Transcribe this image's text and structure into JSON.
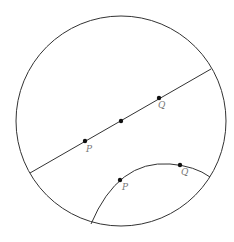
{
  "diagram": {
    "type": "poincare-disk",
    "stroke_color": "#333333",
    "label_color": "#777777",
    "disk": {
      "cx": 121,
      "cy": 121,
      "r": 105
    },
    "euclidean_line": {
      "x1": 30,
      "y1": 173,
      "x2": 211,
      "y2": 69,
      "points": [
        {
          "x": 85,
          "y": 141,
          "label": "P",
          "lx": 86,
          "ly": 152
        },
        {
          "x": 121,
          "y": 121,
          "label": ""
        },
        {
          "x": 159,
          "y": 98,
          "label": "Q",
          "lx": 158,
          "ly": 108
        }
      ]
    },
    "hyperbolic_arc": {
      "path": "M 91 224 Q 118 160 170 164 Q 195 166 210 177",
      "points": [
        {
          "x": 120,
          "y": 180,
          "label": "P",
          "lx": 122,
          "ly": 190
        },
        {
          "x": 180,
          "y": 165,
          "label": "Q",
          "lx": 181,
          "ly": 175
        }
      ]
    }
  }
}
